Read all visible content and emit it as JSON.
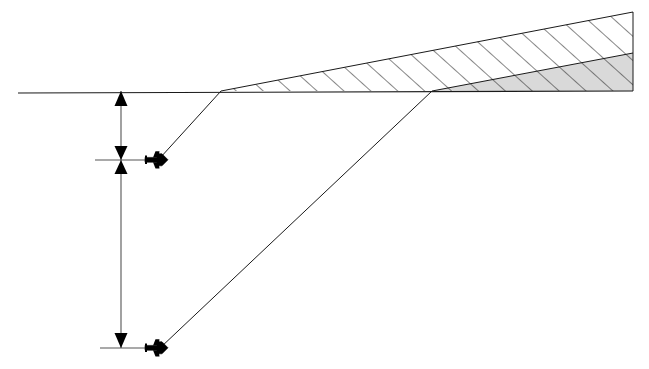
{
  "canvas": {
    "width": 649,
    "height": 369,
    "background": "#ffffff"
  },
  "style": {
    "line_color": "#1a1a1a",
    "line_width": 1,
    "hatch_color": "#222222",
    "hatch_width": 1.1,
    "gray_fill": "#d9d9d9",
    "white_fill": "#ffffff",
    "marker_color": "#000000"
  },
  "figure": {
    "type": "line-diagram"
  },
  "ground_line": {
    "name": "horizon-reference-line",
    "x1": 18,
    "y1": 93,
    "x2": 633,
    "y2": 91
  },
  "coverage_wedge": {
    "name": "hatched-coverage-wedge",
    "apex_x": 221,
    "apex_y": 91,
    "right_x": 633,
    "top_right_y": 12,
    "bottom_right_y": 91,
    "fill": "#ffffff",
    "hatch_angle_deg": 48,
    "hatch_spacing": 18
  },
  "inner_wedge": {
    "name": "gray-inner-wedge",
    "apex_x": 432,
    "apex_y": 91,
    "right_x": 633,
    "top_right_y": 53,
    "bottom_right_y": 91,
    "fill": "#d9d9d9"
  },
  "sight_lines": [
    {
      "name": "sight-line-upper",
      "x1": 221,
      "y1": 91,
      "x2": 160,
      "y2": 158
    },
    {
      "name": "sight-line-lower",
      "x1": 432,
      "y1": 91,
      "x2": 160,
      "y2": 348
    }
  ],
  "platforms": [
    {
      "name": "aircraft-marker-upper",
      "x": 158,
      "y": 160,
      "heading": "right",
      "scale": 1.0
    },
    {
      "name": "aircraft-marker-lower",
      "x": 158,
      "y": 348,
      "heading": "right",
      "scale": 1.0
    }
  ],
  "dimension": {
    "name": "vertical-altitude-dimension",
    "x": 121,
    "y_top": 91,
    "y_mid": 160,
    "y_bottom": 348,
    "top_arrow": "up",
    "mid_marker": "double-arrowhead",
    "bottom_arrow": "down"
  },
  "tick_marks": [
    {
      "name": "tick-mid-altitude",
      "x1": 95,
      "x2": 147,
      "y": 160
    },
    {
      "name": "tick-bottom-altitude",
      "x1": 100,
      "x2": 152,
      "y": 348
    }
  ],
  "labels": {
    "note": "no text labels are rendered in this figure"
  }
}
